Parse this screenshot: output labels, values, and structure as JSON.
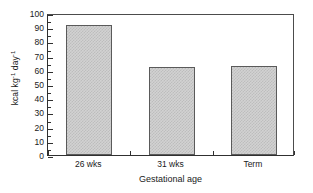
{
  "chart_data": {
    "type": "bar",
    "title": "",
    "subtitle": "",
    "categories": [
      "26 wks",
      "31 wks",
      "Term"
    ],
    "values": [
      91.5,
      62,
      63
    ],
    "xlabel": "Gestational age",
    "ylabel": "kcal kg⁻¹ day⁻¹",
    "ylabel_parts": {
      "base1": "kcal kg",
      "sup1": "-1",
      "base2": " day",
      "sup2": "-1"
    },
    "ylim": [
      0,
      100
    ],
    "ytick_step": 10,
    "yticks": [
      0,
      10,
      20,
      30,
      40,
      50,
      60,
      70,
      80,
      90,
      100
    ],
    "ytick_labels": [
      "0",
      "10",
      "20",
      "30",
      "40",
      "50",
      "60",
      "70",
      "80",
      "90",
      "100"
    ],
    "grid": false,
    "legend": null,
    "legend_position": "none",
    "bar_fill": "#d2d2d2",
    "bar_pattern": "fine-checker-dot",
    "bar_edge_color": "#5a5a5a",
    "axis_color": "#303030",
    "background": "#ffffff",
    "annotations": []
  }
}
